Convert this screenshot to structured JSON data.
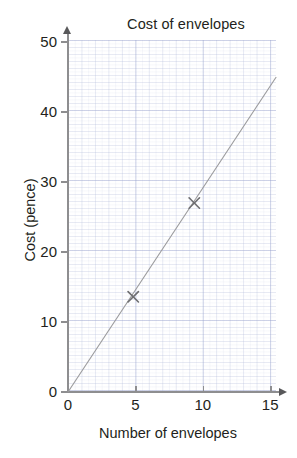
{
  "chart_data": {
    "type": "scatter",
    "title": "Cost of envelopes",
    "xlabel": "Number of envelopes",
    "ylabel": "Cost (pence)",
    "xlim": [
      0,
      15
    ],
    "ylim": [
      0,
      50
    ],
    "xticks": [
      "0",
      "5",
      "10",
      "15"
    ],
    "xtick_values": [
      0,
      5,
      10,
      15
    ],
    "yticks": [
      "0",
      "10",
      "20",
      "30",
      "40",
      "50"
    ],
    "ytick_values": [
      0,
      10,
      20,
      30,
      40,
      50
    ],
    "grid": true,
    "grid_minor": true,
    "legend": "none",
    "series": [
      {
        "name": "Observed points",
        "marker": "x",
        "color": "#6e6e70",
        "points": [
          {
            "x": 4.7,
            "y": 13.6
          },
          {
            "x": 9.1,
            "y": 27.0
          }
        ]
      },
      {
        "name": "Line of best fit",
        "type": "line",
        "color": "#9a9a9c",
        "points": [
          {
            "x": 0,
            "y": 0
          },
          {
            "x": 15,
            "y": 45
          }
        ]
      }
    ],
    "annotations": []
  },
  "axes": {
    "y_ticks": [
      {
        "label": "50",
        "value": 50
      },
      {
        "label": "40",
        "value": 40
      },
      {
        "label": "30",
        "value": 30
      },
      {
        "label": "20",
        "value": 20
      },
      {
        "label": "10",
        "value": 10
      },
      {
        "label": "0",
        "value": 0
      }
    ],
    "x_ticks": [
      {
        "label": "0",
        "value": 0
      },
      {
        "label": "5",
        "value": 5
      },
      {
        "label": "10",
        "value": 10
      },
      {
        "label": "15",
        "value": 15
      }
    ]
  },
  "colors": {
    "ink": "#231f20",
    "axis": "#8e8e90",
    "grid_major": "#96a0cd",
    "grid_minor": "#b9c0dc",
    "line": "#9a9a9c",
    "marker": "#6e6e70",
    "background": "#ffffff"
  }
}
